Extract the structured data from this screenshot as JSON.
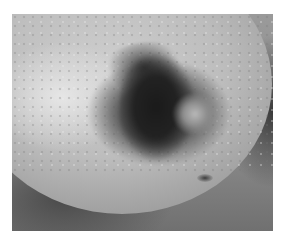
{
  "image": {
    "description": "Grayscale clinical photograph of a pigmented skin lesion",
    "colors": {
      "background": "#ffffff",
      "skin_light": "#d6d6d6",
      "skin_mid": "#b5b5b5",
      "lesion_dark": "#1a1a1a",
      "shadow": "#4a4a4a"
    }
  }
}
